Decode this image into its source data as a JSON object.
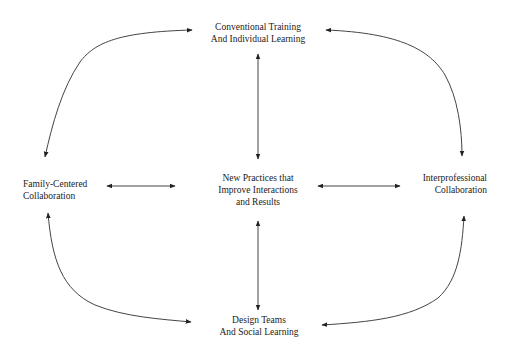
{
  "diagram": {
    "nodes": {
      "top": {
        "lines": [
          "Conventional Training",
          "And Individual Learning"
        ]
      },
      "left": {
        "lines": [
          "Family-Centered",
          "Collaboration"
        ]
      },
      "center": {
        "lines": [
          "New Practices that",
          "Improve Interactions",
          "and Results"
        ]
      },
      "right": {
        "lines": [
          "Interprofessional",
          "Collaboration"
        ]
      },
      "bottom": {
        "lines": [
          "Design Teams",
          "And Social Learning"
        ]
      }
    },
    "edges": [
      {
        "from": "top",
        "to": "center",
        "type": "bidirectional-straight"
      },
      {
        "from": "center",
        "to": "bottom",
        "type": "bidirectional-straight"
      },
      {
        "from": "left",
        "to": "center",
        "type": "bidirectional-straight"
      },
      {
        "from": "center",
        "to": "right",
        "type": "bidirectional-straight"
      },
      {
        "from": "top",
        "to": "left",
        "type": "bidirectional-curved"
      },
      {
        "from": "top",
        "to": "right",
        "type": "bidirectional-curved"
      },
      {
        "from": "left",
        "to": "bottom",
        "type": "bidirectional-curved"
      },
      {
        "from": "right",
        "to": "bottom",
        "type": "bidirectional-curved"
      }
    ],
    "colors": {
      "line": "#333333",
      "text": "#222222",
      "background": "#ffffff"
    }
  }
}
